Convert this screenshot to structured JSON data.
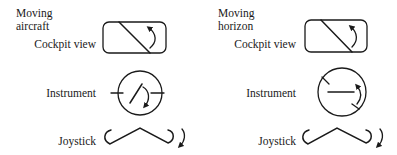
{
  "panels": [
    {
      "id": "moving-aircraft",
      "title_line1": "Moving",
      "title_line2": "aircraft",
      "rows": [
        {
          "label": "Cockpit view",
          "icon": "cockpit-view-icon"
        },
        {
          "label": "Instrument",
          "icon": "instrument-dial-icon"
        },
        {
          "label": "Joystick",
          "icon": "joystick-icon"
        }
      ]
    },
    {
      "id": "moving-horizon",
      "title_line1": "Moving",
      "title_line2": "horizon",
      "rows": [
        {
          "label": "Cockpit view",
          "icon": "cockpit-view-icon"
        },
        {
          "label": "Instrument",
          "icon": "instrument-dial-icon"
        },
        {
          "label": "Joystick",
          "icon": "joystick-icon"
        }
      ]
    }
  ],
  "colors": {
    "stroke": "#1a1a1a",
    "background": "#ffffff"
  }
}
